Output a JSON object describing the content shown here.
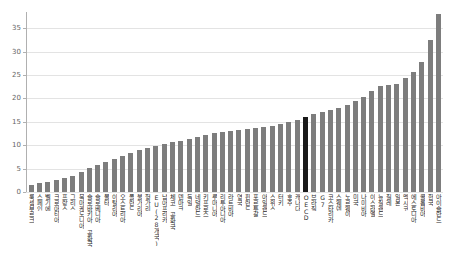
{
  "chart_data": {
    "type": "bar",
    "title": "",
    "subtitle": "",
    "xlabel": "",
    "ylabel": "",
    "ylim": [
      0,
      38.5
    ],
    "grid": true,
    "legend": null,
    "yticks": [
      0,
      5,
      10,
      15,
      20,
      25,
      30,
      35
    ],
    "ytick_labels": [
      "0",
      "5",
      "10",
      "15",
      "20",
      "25",
      "30",
      "35"
    ],
    "highlight_category": "OECD",
    "colors": {
      "bar": "#7d7d7d",
      "highlight_bar": "#1a1a1a",
      "gridline": "#e3e3e3",
      "axis": "#b0b0b0",
      "tick_text": "#666666",
      "background": "#ffffff"
    },
    "categories": [
      "룩셈부르크",
      "스페인",
      "벨기에",
      "크로아티아",
      "프랑스",
      "그리스",
      "북마케도니아",
      "슬로바키아 공화국",
      "슬로베니아",
      "몰타",
      "이탈리아",
      "오스트리아",
      "폴란드",
      "불가리아",
      "헝가리",
      "EU(28개국)",
      "남아프리카",
      "체코 공화국",
      "덴마크",
      "독일",
      "네덜란드",
      "키프로스",
      "루마니아",
      "리투아니아",
      "라트비아",
      "영국",
      "핀란드",
      "포르투갈",
      "아일랜드",
      "스위스",
      "터키",
      "호주",
      "캐나다",
      "OECD",
      "브라질",
      "G7",
      "코스타리카",
      "스웨덴",
      "노르웨이",
      "미국",
      "나미비아",
      "이스라엘",
      "뉴질랜드",
      "칠레",
      "일본",
      "멕시코",
      "에스토니아",
      "콜롬비아",
      "한국",
      "아이슬란드"
    ],
    "values": [
      1.6,
      2.0,
      2.2,
      2.6,
      3.0,
      3.4,
      4.3,
      5.2,
      5.8,
      6.4,
      7.0,
      7.6,
      8.4,
      9.0,
      9.4,
      9.8,
      10.2,
      10.6,
      11.0,
      11.4,
      11.8,
      12.2,
      12.6,
      12.8,
      13.0,
      13.2,
      13.4,
      13.6,
      13.8,
      14.2,
      14.6,
      15.0,
      15.4,
      16.0,
      16.6,
      17.2,
      17.6,
      18.0,
      18.6,
      19.4,
      20.4,
      21.6,
      22.6,
      22.8,
      23.0,
      24.4,
      25.6,
      27.8,
      32.6,
      38.0
    ]
  }
}
